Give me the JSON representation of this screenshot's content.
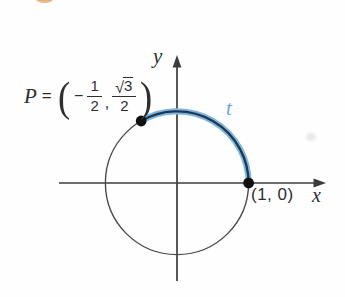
{
  "colors": {
    "background": "#fefefe",
    "axis": "#3c3c3c",
    "circle": "#4a4a4a",
    "arc_outer": "#7fb5dd",
    "arc_core": "#1e3850",
    "point_dot": "#101010",
    "text": "#2e2e2e",
    "arc_label": "#68a6d4",
    "artifact_orange": "#d78a47"
  },
  "p_label": {
    "variable": "P",
    "equals": "=",
    "open_paren": "(",
    "minus": "−",
    "fraction1": {
      "numerator": "1",
      "denominator": "2"
    },
    "comma": ",",
    "fraction2": {
      "radical": "√",
      "numerator": "3",
      "denominator": "2"
    },
    "close_paren": ")"
  },
  "axis_labels": {
    "x": "x",
    "y": "y"
  },
  "arc": {
    "label": "t",
    "from_angle_deg": 0,
    "to_angle_deg": 120
  },
  "points": {
    "p": {
      "x_value": "-1/2",
      "y_value": "√3/2"
    },
    "unit": {
      "label": "(1, 0)"
    }
  }
}
